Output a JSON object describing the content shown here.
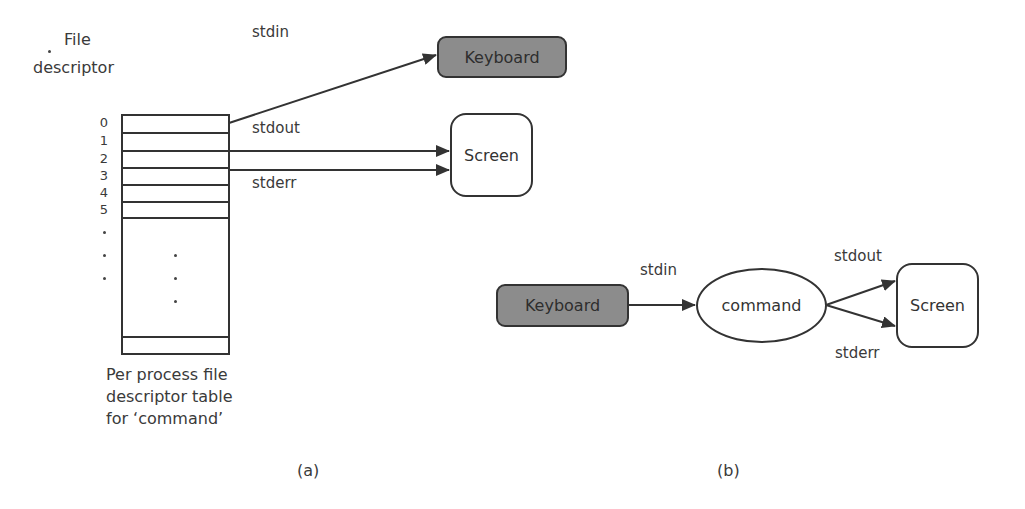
{
  "panel_a": {
    "header_line1": "File",
    "header_line2": "descriptor",
    "row_numbers": [
      "0",
      "1",
      "2",
      "3",
      "4",
      "5"
    ],
    "caption_lines": [
      "Per process file",
      "descriptor table",
      "for ‘command’"
    ],
    "stdin_label": "stdin",
    "stdout_label": "stdout",
    "stderr_label": "stderr",
    "keyboard_label": "Keyboard",
    "screen_label": "Screen",
    "panel_label": "(a)"
  },
  "panel_b": {
    "keyboard_label": "Keyboard",
    "stdin_label": "stdin",
    "command_label": "command",
    "stdout_label": "stdout",
    "stderr_label": "stderr",
    "screen_label": "Screen",
    "panel_label": "(b)"
  },
  "colors": {
    "keyboard_fill": "#8c8c8c",
    "stroke": "#333333",
    "background": "#ffffff"
  }
}
